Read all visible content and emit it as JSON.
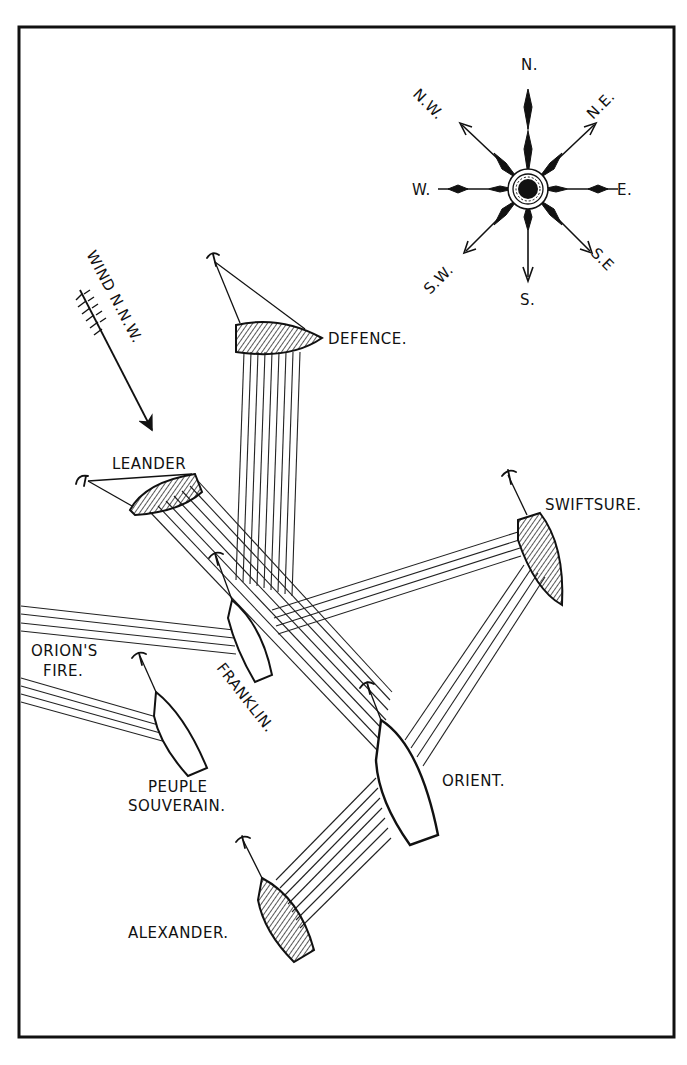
{
  "compass": {
    "labels": {
      "n": "N.",
      "ne": "N.E.",
      "e": "E.",
      "se": "S.E",
      "s": "S.",
      "sw": "S.W.",
      "w": "W.",
      "nw": "N.W."
    }
  },
  "wind": {
    "label": "WIND N.N.W.",
    "direction": "N.N.W."
  },
  "ships": {
    "defence": {
      "name": "DEFENCE.",
      "fleet": "british",
      "hatched": true
    },
    "leander": {
      "name": "LEANDER",
      "fleet": "british",
      "hatched": true
    },
    "swiftsure": {
      "name": "SWIFTSURE.",
      "fleet": "british",
      "hatched": true
    },
    "alexander": {
      "name": "ALEXANDER.",
      "fleet": "british",
      "hatched": true
    },
    "franklin": {
      "name": "FRANKLIN.",
      "fleet": "french",
      "hatched": false
    },
    "orient": {
      "name": "ORIENT.",
      "fleet": "french",
      "hatched": false
    },
    "peuple_souverain": {
      "name_line1": "PEUPLE",
      "name_line2": "SOUVERAIN.",
      "fleet": "french",
      "hatched": false
    },
    "orion": {
      "name_line1": "ORION'S",
      "name_line2": "FIRE.",
      "offscreen": true
    }
  },
  "colors": {
    "ink": "#111111",
    "paper": "#ffffff"
  }
}
